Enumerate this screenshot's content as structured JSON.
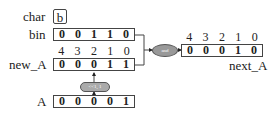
{
  "char": {
    "label": "char",
    "value": "b"
  },
  "bin": {
    "label": "bin",
    "bits": [
      "0",
      "0",
      "1",
      "1",
      "0"
    ]
  },
  "new_A": {
    "label": "new_A",
    "indices": [
      "4",
      "3",
      "2",
      "1",
      "0"
    ],
    "bits": [
      "0",
      "0",
      "0",
      "1",
      "1"
    ]
  },
  "A": {
    "label": "A",
    "bits": [
      "0",
      "0",
      "0",
      "0",
      "1"
    ]
  },
  "next_A": {
    "label": "next_A",
    "indices": [
      "4",
      "3",
      "2",
      "1",
      "0"
    ],
    "bits": [
      "0",
      "0",
      "0",
      "1",
      "0"
    ]
  },
  "ops": {
    "and_label": "and",
    "shift_label": "<<1, 1"
  }
}
